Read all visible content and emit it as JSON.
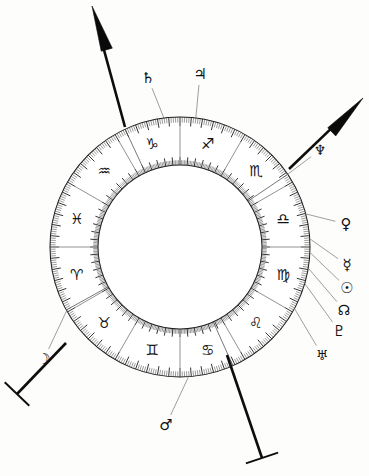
{
  "chart": {
    "type": "astrological-wheel",
    "background_color": "#fdfdfb",
    "ink_color": "#131313",
    "center": {
      "x": 180,
      "y": 247
    },
    "radii": {
      "outer": 130,
      "inner": 82,
      "tick_outer_depth": 9,
      "tick_inner_depth": 8
    },
    "ring": {
      "divisions": 12,
      "degrees_per_division": 30,
      "minor_tick_degrees": 1,
      "major_tick_degrees": 5
    }
  },
  "zodiac_signs": [
    {
      "name": "Sagittarius",
      "glyph": "♐",
      "glyph_name": "sagittarius-glyph",
      "center_angle_deg": 75,
      "order": 9
    },
    {
      "name": "Capricorn",
      "glyph": "♑",
      "glyph_name": "capricorn-glyph",
      "center_angle_deg": 105,
      "order": 10
    },
    {
      "name": "Aquarius",
      "glyph": "♒",
      "glyph_name": "aquarius-glyph",
      "center_angle_deg": 135,
      "order": 11
    },
    {
      "name": "Pisces",
      "glyph": "♓",
      "glyph_name": "pisces-glyph",
      "center_angle_deg": 165,
      "order": 12
    },
    {
      "name": "Aries",
      "glyph": "♈",
      "glyph_name": "aries-glyph",
      "center_angle_deg": 195,
      "order": 1
    },
    {
      "name": "Taurus",
      "glyph": "♉",
      "glyph_name": "taurus-glyph",
      "center_angle_deg": 225,
      "order": 2
    },
    {
      "name": "Gemini",
      "glyph": "♊",
      "glyph_name": "gemini-glyph",
      "center_angle_deg": 255,
      "order": 3
    },
    {
      "name": "Cancer",
      "glyph": "♋",
      "glyph_name": "cancer-glyph",
      "center_angle_deg": 285,
      "order": 4
    },
    {
      "name": "Leo",
      "glyph": "♌",
      "glyph_name": "leo-glyph",
      "center_angle_deg": 315,
      "order": 5
    },
    {
      "name": "Virgo",
      "glyph": "♍",
      "glyph_name": "virgo-glyph",
      "center_angle_deg": 345,
      "order": 6
    },
    {
      "name": "Libra",
      "glyph": "♎",
      "glyph_name": "libra-glyph",
      "center_angle_deg": 15,
      "order": 7
    },
    {
      "name": "Scorpio",
      "glyph": "♏",
      "glyph_name": "scorpio-glyph",
      "center_angle_deg": 45,
      "order": 8
    }
  ],
  "planets": [
    {
      "name": "Saturn",
      "glyph": "♄",
      "glyph_name": "saturn-glyph",
      "angle_deg": 97,
      "label_x": 148,
      "label_y": 78,
      "leader_from_angle": 97,
      "font_size": 15
    },
    {
      "name": "Jupiter",
      "glyph": "♃",
      "glyph_name": "jupiter-glyph",
      "angle_deg": 83,
      "label_x": 200,
      "label_y": 74,
      "leader_from_angle": 83,
      "font_size": 15
    },
    {
      "name": "Neptune",
      "glyph": "♆",
      "glyph_name": "neptune-glyph",
      "angle_deg": 34,
      "label_x": 320,
      "label_y": 150,
      "leader_from_angle": 34,
      "font_size": 14
    },
    {
      "name": "Venus",
      "glyph": "♀",
      "glyph_name": "venus-glyph",
      "angle_deg": 15,
      "label_x": 346,
      "label_y": 224,
      "leader_from_angle": 15,
      "font_size": 15
    },
    {
      "name": "Mercury",
      "glyph": "☿",
      "glyph_name": "mercury-glyph",
      "angle_deg": 4,
      "label_x": 347,
      "label_y": 265,
      "leader_from_angle": 4,
      "font_size": 15
    },
    {
      "name": "Sun",
      "glyph": "☉",
      "glyph_name": "sun-glyph",
      "angle_deg": -2,
      "label_x": 347,
      "label_y": 288,
      "leader_from_angle": -2,
      "font_size": 15
    },
    {
      "name": "North Node",
      "glyph": "☊",
      "glyph_name": "north-node-glyph",
      "angle_deg": -9,
      "label_x": 344,
      "label_y": 310,
      "leader_from_angle": -9,
      "font_size": 14
    },
    {
      "name": "Pluto",
      "glyph": "♇",
      "glyph_name": "pluto-glyph",
      "angle_deg": -16,
      "label_x": 339,
      "label_y": 331,
      "leader_from_angle": -16,
      "font_size": 15
    },
    {
      "name": "Uranus",
      "glyph": "♅",
      "glyph_name": "uranus-glyph",
      "angle_deg": -28,
      "label_x": 322,
      "label_y": 355,
      "leader_from_angle": -28,
      "font_size": 14
    },
    {
      "name": "Mars",
      "glyph": "♂",
      "glyph_name": "mars-glyph",
      "angle_deg": -86,
      "label_x": 166,
      "label_y": 425,
      "leader_from_angle": -86,
      "font_size": 15
    },
    {
      "name": "Moon",
      "glyph": "☽",
      "glyph_name": "moon-glyph",
      "angle_deg": -151,
      "label_x": 44,
      "label_y": 359,
      "leader_from_angle": -151,
      "font_size": 15
    }
  ],
  "axes": [
    {
      "name": "Midheaven Axis",
      "axis_name": "mc-axis",
      "style": "arrow",
      "angle_deg": 115,
      "tip_x": 92,
      "tip_y": 6,
      "base_x": 125,
      "base_y": 127
    },
    {
      "name": "Ascendant Axis",
      "axis_name": "ascendant-axis",
      "style": "arrow",
      "angle_deg": 34,
      "tip_x": 363,
      "tip_y": 98,
      "base_x": 289,
      "base_y": 169
    },
    {
      "name": "Descendant Axis",
      "axis_name": "descendant-axis",
      "style": "tbar",
      "angle_deg": -151,
      "tip_x": 17,
      "tip_y": 394,
      "base_x": 66,
      "base_y": 343
    },
    {
      "name": "Imum Coeli Axis",
      "axis_name": "ic-axis",
      "style": "tbar",
      "angle_deg": -66,
      "tip_x": 262,
      "tip_y": 458,
      "base_x": 227,
      "base_y": 355
    }
  ],
  "house_cusps": [
    {
      "name": "cusp-1",
      "angle_deg": 34
    },
    {
      "name": "cusp-4",
      "angle_deg": -66
    },
    {
      "name": "cusp-7",
      "angle_deg": -151
    },
    {
      "name": "cusp-10",
      "angle_deg": 115
    }
  ]
}
